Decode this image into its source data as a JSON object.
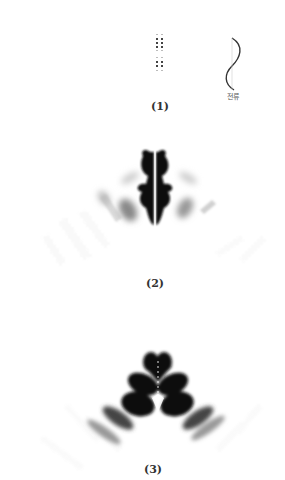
{
  "figure": {
    "panels": [
      {
        "id": "1",
        "caption": "(1)",
        "description": "Two small dot arrays (source element grids) and a sinusoidal current distribution",
        "current_label": "전류"
      },
      {
        "id": "2",
        "caption": "(2)",
        "description": "Radiation/field intensity pattern with central vertical split lobes and faint side fringes"
      },
      {
        "id": "3",
        "caption": "(3)",
        "description": "Radiation/field intensity pattern with stacked heart-shaped central lobes and arc-shaped side fringes"
      }
    ],
    "colors": {
      "ink": "#111111",
      "mid": "#666666",
      "faint": "#bbbbbb",
      "background": "#ffffff"
    }
  }
}
